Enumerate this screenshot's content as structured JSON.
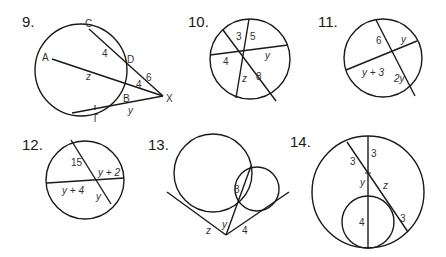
{
  "problems": [
    {
      "number": "9.",
      "points": {
        "C": "C",
        "A": "A",
        "D": "D",
        "B": "B",
        "X": "X",
        "T": "T"
      },
      "labels": {
        "CD": "4",
        "AB": "z",
        "BX": "4",
        "DX": "6",
        "TX": "y"
      }
    },
    {
      "number": "10.",
      "labels": {
        "a": "3",
        "b": "5",
        "c": "y",
        "d": "4",
        "e": "z",
        "f": "8"
      }
    },
    {
      "number": "11.",
      "labels": {
        "a": "6",
        "b": "y",
        "c": "y + 3",
        "d": "2y"
      }
    },
    {
      "number": "12.",
      "labels": {
        "a": "15",
        "b": "y + 2",
        "c": "y + 4",
        "d": "y"
      }
    },
    {
      "number": "13.",
      "labels": {
        "a": "8",
        "b": "y",
        "c": "z",
        "d": "4"
      }
    },
    {
      "number": "14.",
      "labels": {
        "a": "3",
        "b": "3",
        "c": "y",
        "d": "z",
        "e": "4",
        "f": "3"
      }
    }
  ]
}
